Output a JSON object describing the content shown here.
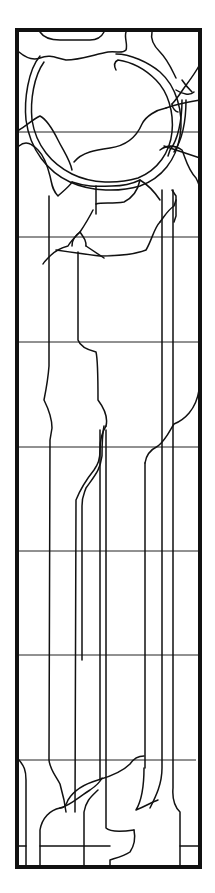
{
  "diagram": {
    "type": "line-art panel",
    "background": "#ffffff",
    "stroke_color": "#111111",
    "frame": {
      "x": 17,
      "y": 30,
      "width": 183,
      "height": 837,
      "stroke_width": 4
    },
    "horizontal_gridlines_y": [
      132,
      237,
      342,
      447,
      551,
      655,
      760
    ],
    "vertical_lines_x": [
      49,
      75,
      82,
      100,
      106,
      145,
      162,
      173
    ],
    "motif": "ring (circle band) in upper section with branching lead lines descending into long vertical strips, converging at bottom"
  }
}
